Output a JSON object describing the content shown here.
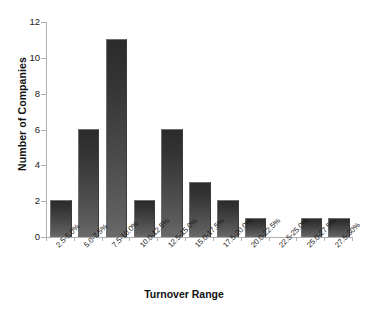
{
  "chart_data": {
    "type": "bar",
    "title": "",
    "xlabel": "Turnover Range",
    "ylabel": "Number of Companies",
    "categories": [
      "2.5-5.0%",
      "5.0-7.5%",
      "7.5-10.0%",
      "10.0-12.5%",
      "12.5-15.0%",
      "15.0-17.5%",
      "17.5-20.0%",
      "20.0-22.5%",
      "22.5-25.0%",
      "25.0-27.5%",
      "27.5-30%"
    ],
    "values": [
      2,
      6,
      11,
      2,
      6,
      3,
      2,
      1,
      0,
      1,
      1
    ],
    "ylim": [
      0,
      12
    ],
    "yticks": [
      0,
      2,
      4,
      6,
      8,
      10,
      12
    ],
    "ytick_labels": [
      "0",
      "2",
      "4",
      "6",
      "8",
      "10",
      "12"
    ],
    "grid": false,
    "legend": null,
    "bar_color": "#3f3f3f",
    "axis_color": "#b0b0b0",
    "background": "#ffffff"
  }
}
